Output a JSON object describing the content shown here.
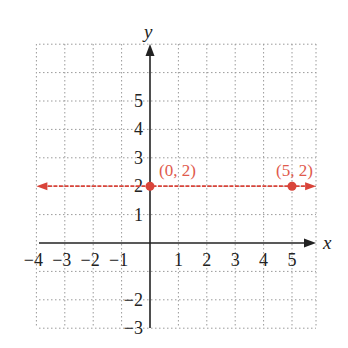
{
  "chart_data": {
    "type": "line",
    "title": "",
    "xlabel": "x",
    "ylabel": "y",
    "xlim": [
      -4,
      5.85
    ],
    "ylim": [
      -3,
      7
    ],
    "grid": true,
    "grid_style": "dotted",
    "x_ticks": [
      -4,
      -3,
      -2,
      -1,
      1,
      2,
      3,
      4,
      5
    ],
    "x_tick_labels": [
      "−4",
      "−3",
      "−2",
      "−1",
      "1",
      "2",
      "3",
      "4",
      "5"
    ],
    "y_ticks": [
      -3,
      -2,
      1,
      2,
      3,
      4,
      5
    ],
    "y_tick_labels": [
      "−3",
      "−2",
      "1",
      "2",
      "3",
      "4",
      "5"
    ],
    "series": [
      {
        "name": "y = 2",
        "kind": "horizontal-line",
        "y": 2,
        "x_range": [
          -4,
          5.85
        ],
        "arrows_both_ends": true,
        "color": "#d9443a",
        "style": "dashed"
      }
    ],
    "points": [
      {
        "x": 0,
        "y": 2,
        "label": "(0, 2)"
      },
      {
        "x": 5,
        "y": 2,
        "label": "(5, 2)"
      }
    ],
    "colors": {
      "line": "#d9443a",
      "label": "#e05a4c",
      "axis": "#222222",
      "grid": "#9a9a9a"
    }
  }
}
